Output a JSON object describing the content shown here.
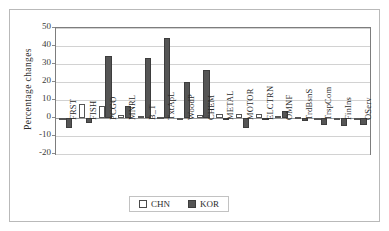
{
  "chart_data": {
    "type": "bar",
    "title": "",
    "xlabel": "",
    "ylabel": "Percentage changes",
    "ylim": [
      -20,
      50
    ],
    "ytick_step": 10,
    "yticks": [
      50,
      40,
      30,
      20,
      10,
      0,
      -10,
      -20
    ],
    "ytick_labels": [
      "50",
      "40",
      "30",
      "20",
      "10",
      "0",
      "-10",
      "-20"
    ],
    "grid": true,
    "legend_position": "bottom-center",
    "categories": [
      "FRST",
      "FISH",
      "PCGO",
      "MNRL",
      "B_T",
      "TxtApL",
      "WoodP",
      "CHEM",
      "METAL",
      "MOTOR",
      "ELCTRN",
      "OMNF",
      "TrdBsnS",
      "TrspCom",
      "FinIns",
      "OServ"
    ],
    "series": [
      {
        "name": "CHN",
        "color": "#ffffff",
        "edge_color": "#555555",
        "values": [
          -0.5,
          8.0,
          6.5,
          1.5,
          1.0,
          0.8,
          -0.5,
          1.8,
          2.0,
          2.5,
          2.3,
          1.0,
          0.3,
          -0.3,
          -0.3,
          -0.3
        ]
      },
      {
        "name": "KOR",
        "color": "#555555",
        "edge_color": "#3d3d3d",
        "values": [
          -5.5,
          -2.5,
          34.5,
          6.5,
          33.5,
          44.5,
          19.8,
          26.5,
          -0.8,
          -5.5,
          0.0,
          4.0,
          -1.5,
          -4.0,
          -4.5,
          -4.0
        ]
      }
    ]
  },
  "legend": {
    "entries": [
      {
        "label": "CHN"
      },
      {
        "label": "KOR"
      }
    ]
  },
  "axis": {
    "y_title": "Percentage changes"
  }
}
